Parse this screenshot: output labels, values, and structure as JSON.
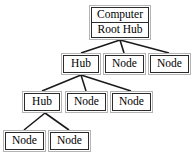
{
  "diagram": {
    "type": "usb-device-tree",
    "title": "",
    "background_color": "#ffffff",
    "box_border_color": "#2b2b2b",
    "box_outer_border_color": "#b4b4b4",
    "box_fill_color": "#ffffff",
    "edge_color": "#1a1a1a",
    "text_color": "#000000",
    "nodes": [
      {
        "id": "root",
        "labels": [
          "Computer",
          "Root Hub"
        ],
        "kind": "root-hub",
        "x": 89,
        "y": 5,
        "width": 62,
        "height": 35,
        "rows": 2
      },
      {
        "id": "hub-l2",
        "labels": [
          "Hub"
        ],
        "kind": "hub",
        "x": 61,
        "y": 53,
        "width": 40,
        "height": 22,
        "rows": 1
      },
      {
        "id": "node-l2-a",
        "labels": [
          "Node"
        ],
        "kind": "node",
        "x": 103,
        "y": 53,
        "width": 43,
        "height": 22,
        "rows": 1
      },
      {
        "id": "node-l2-b",
        "labels": [
          "Node"
        ],
        "kind": "node",
        "x": 148,
        "y": 53,
        "width": 43,
        "height": 22,
        "rows": 1
      },
      {
        "id": "hub-l3",
        "labels": [
          "Hub"
        ],
        "kind": "hub",
        "x": 22,
        "y": 91,
        "width": 40,
        "height": 22,
        "rows": 1
      },
      {
        "id": "node-l3-a",
        "labels": [
          "Node"
        ],
        "kind": "node",
        "x": 65,
        "y": 91,
        "width": 43,
        "height": 22,
        "rows": 1
      },
      {
        "id": "node-l3-b",
        "labels": [
          "Node"
        ],
        "kind": "node",
        "x": 110,
        "y": 91,
        "width": 43,
        "height": 22,
        "rows": 1
      },
      {
        "id": "node-l4-a",
        "labels": [
          "Node"
        ],
        "kind": "node",
        "x": 3,
        "y": 130,
        "width": 43,
        "height": 22,
        "rows": 1
      },
      {
        "id": "node-l4-b",
        "labels": [
          "Node"
        ],
        "kind": "node",
        "x": 48,
        "y": 130,
        "width": 43,
        "height": 22,
        "rows": 1
      }
    ],
    "edges": [
      {
        "from": "root",
        "to": "hub-l2",
        "x1": 120,
        "y1": 40,
        "x2": 81,
        "y2": 53
      },
      {
        "from": "root",
        "to": "node-l2-a",
        "x1": 120,
        "y1": 40,
        "x2": 124,
        "y2": 53
      },
      {
        "from": "root",
        "to": "node-l2-b",
        "x1": 120,
        "y1": 40,
        "x2": 169,
        "y2": 53
      },
      {
        "from": "hub-l2",
        "to": "hub-l3",
        "x1": 81,
        "y1": 75,
        "x2": 42,
        "y2": 91
      },
      {
        "from": "hub-l2",
        "to": "node-l3-a",
        "x1": 81,
        "y1": 75,
        "x2": 86,
        "y2": 91
      },
      {
        "from": "hub-l2",
        "to": "node-l3-b",
        "x1": 81,
        "y1": 75,
        "x2": 131,
        "y2": 91
      },
      {
        "from": "hub-l3",
        "to": "node-l4-a",
        "x1": 45,
        "y1": 113,
        "x2": 24,
        "y2": 130
      },
      {
        "from": "hub-l3",
        "to": "node-l4-b",
        "x1": 45,
        "y1": 113,
        "x2": 69,
        "y2": 130
      }
    ]
  }
}
